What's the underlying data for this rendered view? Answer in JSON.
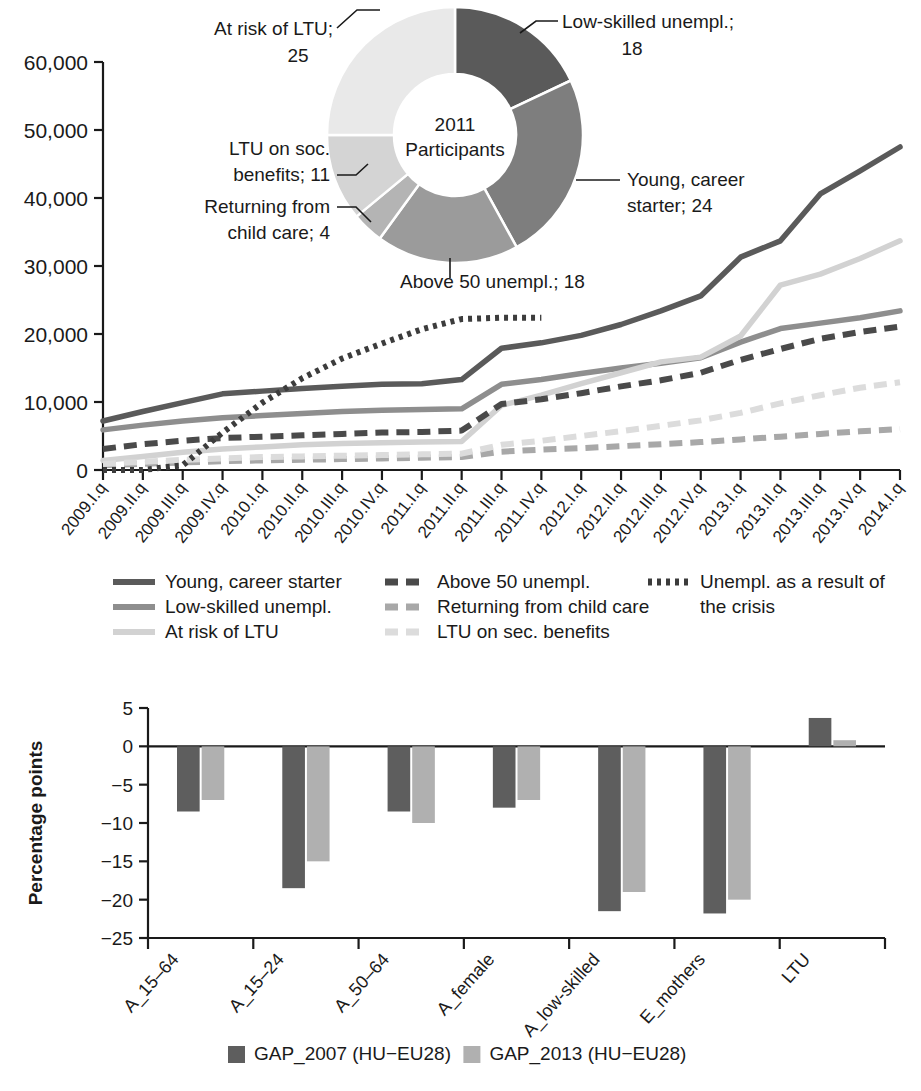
{
  "chart_data": [
    {
      "type": "line",
      "title": "",
      "xlabel": "",
      "ylabel": "",
      "ylim": [
        0,
        60000
      ],
      "ytick_labels": [
        "0",
        "10,000",
        "20,000",
        "30,000",
        "40,000",
        "50,000",
        "60,000"
      ],
      "ytick_values": [
        0,
        10000,
        20000,
        30000,
        40000,
        50000,
        60000
      ],
      "grid": false,
      "legend_position": "below",
      "categories": [
        "2009.I.q",
        "2009.II.q",
        "2009.III.q",
        "2009.IV.q",
        "2010.I.q",
        "2010.II.q",
        "2010.III.q",
        "2010.IV.q",
        "2011.I.q",
        "2011.II.q",
        "2011.III.q",
        "2011.IV.q",
        "2012.I.q",
        "2012.II.q",
        "2012.III.q",
        "2012.IV.q",
        "2013.I.q",
        "2013.II.q",
        "2013.III.q",
        "2013.IV.q",
        "2014.I.q"
      ],
      "series": [
        {
          "name": "Young, career starter",
          "style": "solid",
          "color": "#5a5a5a",
          "values": [
            7200,
            8600,
            9900,
            11200,
            11600,
            12000,
            12300,
            12600,
            12700,
            13300,
            17900,
            18700,
            19800,
            21400,
            23400,
            25600,
            31300,
            33700,
            40600,
            44000,
            47500
          ]
        },
        {
          "name": "Low-skilled unempl.",
          "style": "solid",
          "color": "#8e8e8e",
          "values": [
            5900,
            6600,
            7200,
            7700,
            8000,
            8300,
            8600,
            8800,
            8900,
            9000,
            12600,
            13300,
            14200,
            15000,
            15700,
            16500,
            18800,
            20800,
            21600,
            22400,
            23400
          ]
        },
        {
          "name": "At risk of LTU",
          "style": "solid",
          "color": "#d2d2d2",
          "values": [
            1400,
            2000,
            2600,
            3100,
            3400,
            3700,
            3900,
            4000,
            4100,
            4200,
            9500,
            11000,
            12700,
            14300,
            15900,
            16600,
            19700,
            27200,
            28800,
            31100,
            33700
          ]
        },
        {
          "name": "Above 50 unempl.",
          "style": "dashed",
          "color": "#4a4a4a",
          "values": [
            3100,
            3800,
            4300,
            4700,
            4900,
            5100,
            5300,
            5500,
            5600,
            5800,
            9700,
            10400,
            11300,
            12300,
            13200,
            14300,
            16200,
            17800,
            19300,
            20300,
            21100
          ]
        },
        {
          "name": "Returning from child care",
          "style": "dashed",
          "color": "#a8a8a8",
          "values": [
            700,
            900,
            1100,
            1300,
            1400,
            1500,
            1600,
            1700,
            1800,
            1900,
            2700,
            3000,
            3200,
            3500,
            3800,
            4100,
            4500,
            4900,
            5300,
            5700,
            6000
          ]
        },
        {
          "name": "LTU on sec. benefits",
          "style": "dashed",
          "color": "#dcdcdc",
          "values": [
            900,
            1200,
            1500,
            1700,
            1900,
            2000,
            2100,
            2200,
            2300,
            2400,
            3700,
            4300,
            5000,
            5700,
            6500,
            7300,
            8400,
            9800,
            11000,
            12100,
            12900
          ]
        },
        {
          "name": "Unempl. as a result of the crisis",
          "style": "dotted",
          "color": "#3c3c3c",
          "values": [
            0,
            0,
            700,
            5500,
            9900,
            13500,
            16400,
            18600,
            20700,
            22200,
            22400,
            22400,
            null,
            null,
            null,
            null,
            null,
            null,
            null,
            null,
            null
          ]
        }
      ]
    },
    {
      "type": "pie",
      "subtype": "donut",
      "center_line1": "2011",
      "center_line2": "Participants",
      "slices": [
        {
          "label": "Low-skilled unempl.",
          "value": 18,
          "color": "#5a5a5a"
        },
        {
          "label": "Young, career starter",
          "value": 24,
          "color": "#7e7e7e"
        },
        {
          "label": "Above 50 unempl.",
          "value": 18,
          "color": "#9b9b9b"
        },
        {
          "label": "Returning from child care",
          "value": 4,
          "color": "#b4b4b4"
        },
        {
          "label": "LTU on soc. benefits",
          "value": 11,
          "color": "#d4d4d4"
        },
        {
          "label": "At risk of LTU",
          "value": 25,
          "color": "#e9e9e9"
        }
      ],
      "annotations": [
        {
          "text_line1": "At risk of LTU;",
          "text_line2": "25"
        },
        {
          "text_line1": "Low-skilled unempl.;",
          "text_line2": "18"
        },
        {
          "text_line1": "Young, career",
          "text_line2": "starter; 24"
        },
        {
          "text_line1": "Above 50 unempl.; 18",
          "text_line2": ""
        },
        {
          "text_line1": "Returning from",
          "text_line2": "child care; 4"
        },
        {
          "text_line1": "LTU on soc.",
          "text_line2": "benefits; 11"
        }
      ]
    },
    {
      "type": "bar",
      "title": "",
      "xlabel": "",
      "ylabel": "Percentage points",
      "ylim": [
        -25,
        5
      ],
      "ytick_labels": [
        "5",
        "0",
        "−5",
        "−10",
        "−15",
        "−20",
        "−25"
      ],
      "ytick_values": [
        5,
        0,
        -5,
        -10,
        -15,
        -20,
        -25
      ],
      "grid": false,
      "legend_position": "below",
      "categories": [
        "A_15–64",
        "A_15–24",
        "A_50–64",
        "A_female",
        "A_low-skilled",
        "E_mothers",
        "LTU"
      ],
      "series": [
        {
          "name": "GAP_2007 (HU−EU28)",
          "color": "#5e5e5e",
          "values": [
            -8.5,
            -18.5,
            -8.5,
            -8.0,
            -21.5,
            -21.8,
            3.7
          ]
        },
        {
          "name": "GAP_2013 (HU−EU28)",
          "color": "#b0b0b0",
          "values": [
            -7.0,
            -15.0,
            -10.0,
            -7.0,
            -19.0,
            -20.0,
            0.8
          ]
        }
      ]
    }
  ],
  "line_chart": {
    "legend": [
      {
        "label": "Young, career starter",
        "style": "solid",
        "color": "#5a5a5a"
      },
      {
        "label": "Low-skilled unempl.",
        "style": "solid",
        "color": "#8e8e8e"
      },
      {
        "label": "At risk of LTU",
        "style": "solid",
        "color": "#d2d2d2"
      },
      {
        "label": "Above 50 unempl.",
        "style": "dashed",
        "color": "#4a4a4a"
      },
      {
        "label": "Returning from child care",
        "style": "dashed",
        "color": "#a8a8a8"
      },
      {
        "label": "LTU on sec. benefits",
        "style": "dashed",
        "color": "#dcdcdc"
      },
      {
        "label_line1": "Unempl. as a result of",
        "label_line2": "the crisis",
        "style": "dotted",
        "color": "#3c3c3c"
      }
    ]
  },
  "bar_chart": {
    "axis_title": "Percentage points",
    "legend": [
      {
        "label": "GAP_2007 (HU−EU28)",
        "color": "#5e5e5e"
      },
      {
        "label": "GAP_2013 (HU−EU28)",
        "color": "#b0b0b0"
      }
    ]
  }
}
